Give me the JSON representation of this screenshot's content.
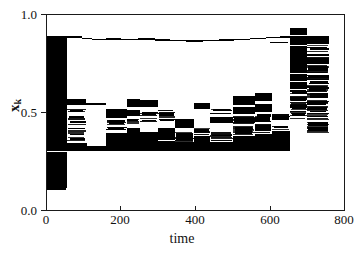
{
  "figure": {
    "background": "#ffffff",
    "ink": "#000000"
  },
  "axes": {
    "x": {
      "label": "time",
      "min": 0,
      "max": 800,
      "ticks": [
        0,
        200,
        400,
        600,
        800
      ],
      "tick_labels": [
        "0",
        "200",
        "400",
        "600",
        "800"
      ]
    },
    "y": {
      "label": "x",
      "label_subscript": "k",
      "min": 0.0,
      "max": 1.0,
      "ticks": [
        0.0,
        0.5,
        1.0
      ],
      "tick_labels": [
        "0.0",
        "0.5",
        "1.0"
      ]
    }
  },
  "chart_data": {
    "type": "scatter",
    "title": "",
    "xlabel": "time",
    "ylabel": "x_k",
    "xlim": [
      0,
      800
    ],
    "ylim": [
      0.0,
      1.0
    ],
    "grid": false,
    "legend": false,
    "marker": "thin horizontal dash",
    "bands": [
      {
        "name": "initial-transient",
        "t0": 0,
        "t1": 55,
        "y0": 0.11,
        "y1": 0.89,
        "density": 1.0
      },
      {
        "name": "upper-laminar-line",
        "t0": 55,
        "t1": 800,
        "y0": 0.875,
        "y1": 0.895,
        "density": 0.22
      },
      {
        "name": "lower-laminar-line",
        "t0": 700,
        "t1": 800,
        "y0": 0.375,
        "y1": 0.385,
        "density": 0.25
      },
      {
        "name": "second-burst",
        "t0": 655,
        "t1": 760,
        "y0": 0.4,
        "y1": 0.93,
        "density": 0.85
      },
      {
        "name": "mid-chaotic-phase",
        "t0": 55,
        "t1": 655,
        "y0": 0.3,
        "y1": 0.6,
        "density": 0.6
      }
    ],
    "segments": [
      [
        0,
        55,
        0.112,
        0.135,
        1
      ],
      [
        0,
        55,
        0.135,
        0.3,
        1
      ],
      [
        0,
        55,
        0.3,
        0.56,
        1
      ],
      [
        0,
        55,
        0.56,
        0.76,
        1
      ],
      [
        0,
        55,
        0.76,
        0.86,
        1
      ],
      [
        0,
        55,
        0.86,
        0.893,
        1
      ],
      [
        0,
        52,
        0.1,
        0.118,
        1
      ],
      [
        2,
        50,
        0.145,
        0.16,
        1
      ],
      [
        1,
        53,
        0.205,
        0.222,
        1
      ],
      [
        3,
        51,
        0.34,
        0.356,
        1
      ],
      [
        0,
        54,
        0.43,
        0.448,
        1
      ],
      [
        2,
        52,
        0.505,
        0.52,
        1
      ],
      [
        1,
        53,
        0.61,
        0.626,
        1
      ],
      [
        0,
        55,
        0.7,
        0.716,
        1
      ],
      [
        4,
        50,
        0.8,
        0.815,
        1
      ],
      [
        55,
        95,
        0.88,
        0.893,
        1
      ],
      [
        95,
        120,
        0.876,
        0.884,
        1
      ],
      [
        120,
        160,
        0.872,
        0.879,
        1
      ],
      [
        160,
        200,
        0.874,
        0.881,
        1
      ],
      [
        200,
        245,
        0.87,
        0.877,
        1
      ],
      [
        245,
        290,
        0.873,
        0.88,
        1
      ],
      [
        290,
        330,
        0.868,
        0.875,
        1
      ],
      [
        330,
        375,
        0.866,
        0.873,
        1
      ],
      [
        375,
        420,
        0.863,
        0.87,
        1
      ],
      [
        420,
        462,
        0.866,
        0.873,
        1
      ],
      [
        462,
        505,
        0.869,
        0.876,
        1
      ],
      [
        505,
        548,
        0.872,
        0.879,
        1
      ],
      [
        548,
        590,
        0.876,
        0.883,
        1
      ],
      [
        590,
        628,
        0.88,
        0.887,
        1
      ],
      [
        628,
        655,
        0.884,
        0.891,
        1
      ],
      [
        600,
        650,
        0.856,
        0.863,
        1
      ],
      [
        655,
        700,
        0.884,
        0.893,
        1
      ],
      [
        55,
        105,
        0.54,
        0.57,
        1
      ],
      [
        55,
        105,
        0.5,
        0.52,
        0.6
      ],
      [
        55,
        105,
        0.47,
        0.486,
        0.55
      ],
      [
        55,
        105,
        0.44,
        0.455,
        0.5
      ],
      [
        55,
        105,
        0.41,
        0.424,
        0.5
      ],
      [
        55,
        105,
        0.385,
        0.398,
        0.55
      ],
      [
        55,
        105,
        0.358,
        0.372,
        0.6
      ],
      [
        55,
        108,
        0.3,
        0.345,
        1
      ],
      [
        105,
        160,
        0.54,
        0.55,
        0.8
      ],
      [
        108,
        160,
        0.3,
        0.33,
        1
      ],
      [
        160,
        215,
        0.47,
        0.52,
        1
      ],
      [
        160,
        215,
        0.44,
        0.46,
        0.65
      ],
      [
        160,
        215,
        0.405,
        0.428,
        0.7
      ],
      [
        160,
        215,
        0.33,
        0.395,
        1
      ],
      [
        160,
        215,
        0.3,
        0.33,
        1
      ],
      [
        215,
        250,
        0.53,
        0.57,
        1
      ],
      [
        215,
        250,
        0.48,
        0.512,
        1
      ],
      [
        215,
        250,
        0.44,
        0.468,
        0.7
      ],
      [
        215,
        250,
        0.34,
        0.42,
        1
      ],
      [
        215,
        250,
        0.3,
        0.336,
        1
      ],
      [
        250,
        300,
        0.53,
        0.565,
        1
      ],
      [
        250,
        300,
        0.488,
        0.505,
        0.55
      ],
      [
        250,
        300,
        0.455,
        0.47,
        0.6
      ],
      [
        250,
        300,
        0.33,
        0.4,
        1
      ],
      [
        250,
        300,
        0.3,
        0.33,
        1
      ],
      [
        300,
        345,
        0.48,
        0.512,
        0.7
      ],
      [
        300,
        345,
        0.455,
        0.47,
        0.55
      ],
      [
        300,
        345,
        0.36,
        0.42,
        1
      ],
      [
        300,
        345,
        0.305,
        0.352,
        1
      ],
      [
        345,
        395,
        0.42,
        0.465,
        1
      ],
      [
        345,
        395,
        0.352,
        0.4,
        0.8
      ],
      [
        345,
        395,
        0.305,
        0.348,
        1
      ],
      [
        395,
        440,
        0.52,
        0.548,
        1
      ],
      [
        395,
        440,
        0.39,
        0.42,
        0.75
      ],
      [
        395,
        440,
        0.305,
        0.378,
        1
      ],
      [
        440,
        500,
        0.5,
        0.52,
        0.6
      ],
      [
        440,
        500,
        0.445,
        0.478,
        1
      ],
      [
        440,
        500,
        0.36,
        0.4,
        0.8
      ],
      [
        440,
        500,
        0.302,
        0.35,
        1
      ],
      [
        500,
        560,
        0.54,
        0.585,
        1
      ],
      [
        500,
        560,
        0.49,
        0.53,
        1
      ],
      [
        500,
        560,
        0.445,
        0.482,
        0.8
      ],
      [
        500,
        560,
        0.39,
        0.43,
        0.9
      ],
      [
        500,
        560,
        0.3,
        0.382,
        1
      ],
      [
        560,
        605,
        0.56,
        0.6,
        1
      ],
      [
        560,
        605,
        0.5,
        0.545,
        1
      ],
      [
        560,
        605,
        0.455,
        0.492,
        0.7
      ],
      [
        560,
        605,
        0.4,
        0.44,
        0.85
      ],
      [
        560,
        605,
        0.305,
        0.39,
        1
      ],
      [
        605,
        655,
        0.465,
        0.49,
        0.8
      ],
      [
        605,
        655,
        0.415,
        0.44,
        0.7
      ],
      [
        605,
        655,
        0.3,
        0.405,
        1
      ],
      [
        655,
        700,
        0.895,
        0.932,
        1
      ],
      [
        655,
        700,
        0.845,
        0.89,
        1
      ],
      [
        655,
        700,
        0.79,
        0.842,
        1
      ],
      [
        655,
        700,
        0.745,
        0.788,
        1
      ],
      [
        655,
        700,
        0.7,
        0.742,
        1
      ],
      [
        655,
        700,
        0.66,
        0.698,
        1
      ],
      [
        655,
        700,
        0.62,
        0.656,
        1
      ],
      [
        655,
        700,
        0.585,
        0.616,
        0.8
      ],
      [
        655,
        700,
        0.548,
        0.578,
        0.7
      ],
      [
        655,
        700,
        0.51,
        0.542,
        0.8
      ],
      [
        655,
        700,
        0.47,
        0.505,
        0.75
      ],
      [
        700,
        760,
        0.85,
        0.89,
        1
      ],
      [
        700,
        760,
        0.82,
        0.845,
        0.6
      ],
      [
        700,
        760,
        0.785,
        0.815,
        0.8
      ],
      [
        700,
        760,
        0.748,
        0.78,
        1
      ],
      [
        700,
        760,
        0.712,
        0.744,
        0.7
      ],
      [
        700,
        760,
        0.675,
        0.706,
        0.75
      ],
      [
        700,
        760,
        0.64,
        0.67,
        0.6
      ],
      [
        700,
        760,
        0.605,
        0.635,
        0.7
      ],
      [
        700,
        760,
        0.57,
        0.6,
        0.65
      ],
      [
        700,
        760,
        0.535,
        0.566,
        0.7
      ],
      [
        700,
        760,
        0.5,
        0.53,
        0.6
      ],
      [
        700,
        760,
        0.465,
        0.495,
        0.8
      ],
      [
        700,
        760,
        0.432,
        0.46,
        0.9
      ],
      [
        700,
        760,
        0.4,
        0.428,
        0.7
      ]
    ]
  }
}
